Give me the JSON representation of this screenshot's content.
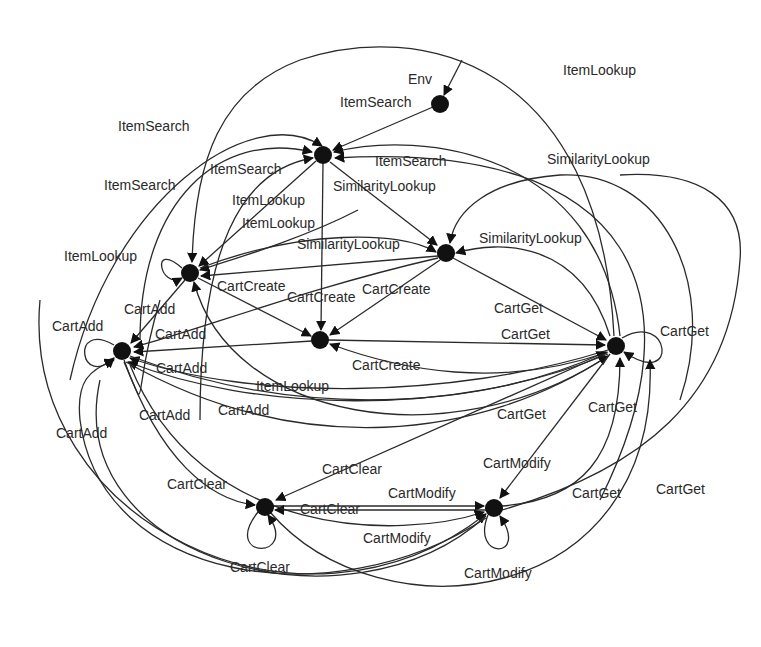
{
  "diagram": {
    "title": "",
    "start_label": "Env",
    "nodes": [
      {
        "id": "start",
        "x": 440,
        "y": 104
      },
      {
        "id": "itemsearch",
        "x": 323,
        "y": 155
      },
      {
        "id": "itemlookup",
        "x": 190,
        "y": 273
      },
      {
        "id": "similarity",
        "x": 446,
        "y": 253
      },
      {
        "id": "cartcreate",
        "x": 320,
        "y": 340
      },
      {
        "id": "cartadd",
        "x": 122,
        "y": 351
      },
      {
        "id": "cartget",
        "x": 616,
        "y": 346
      },
      {
        "id": "cartclear",
        "x": 265,
        "y": 507
      },
      {
        "id": "cartmodify",
        "x": 494,
        "y": 508
      }
    ],
    "labels": [
      {
        "text": "Env",
        "x": 408,
        "y": 84
      },
      {
        "text": "ItemSearch",
        "x": 340,
        "y": 107
      },
      {
        "text": "ItemLookup",
        "x": 563,
        "y": 75
      },
      {
        "text": "ItemSearch",
        "x": 118,
        "y": 131
      },
      {
        "text": "ItemSearch",
        "x": 375,
        "y": 166
      },
      {
        "text": "ItemSearch",
        "x": 210,
        "y": 174
      },
      {
        "text": "ItemSearch",
        "x": 104,
        "y": 190
      },
      {
        "text": "SimilarityLookup",
        "x": 547,
        "y": 164
      },
      {
        "text": "SimilarityLookup",
        "x": 333,
        "y": 191
      },
      {
        "text": "ItemLookup",
        "x": 232,
        "y": 205
      },
      {
        "text": "ItemLookup",
        "x": 242,
        "y": 228
      },
      {
        "text": "SimilarityLookup",
        "x": 297,
        "y": 249
      },
      {
        "text": "SimilarityLookup",
        "x": 479,
        "y": 243
      },
      {
        "text": "ItemLookup",
        "x": 64,
        "y": 261
      },
      {
        "text": "CartCreate",
        "x": 217,
        "y": 291
      },
      {
        "text": "CartCreate",
        "x": 287,
        "y": 302
      },
      {
        "text": "CartCreate",
        "x": 362,
        "y": 294
      },
      {
        "text": "CartAdd",
        "x": 124,
        "y": 314
      },
      {
        "text": "CartGet",
        "x": 494,
        "y": 313
      },
      {
        "text": "CartAdd",
        "x": 52,
        "y": 331
      },
      {
        "text": "CartAdd",
        "x": 155,
        "y": 339
      },
      {
        "text": "CartGet",
        "x": 501,
        "y": 339
      },
      {
        "text": "CartGet",
        "x": 660,
        "y": 336
      },
      {
        "text": "CartAdd",
        "x": 156,
        "y": 373
      },
      {
        "text": "CartCreate",
        "x": 352,
        "y": 370
      },
      {
        "text": "ItemLookup",
        "x": 256,
        "y": 391
      },
      {
        "text": "CartAdd",
        "x": 218,
        "y": 415
      },
      {
        "text": "CartGet",
        "x": 497,
        "y": 419
      },
      {
        "text": "CartGet",
        "x": 588,
        "y": 412
      },
      {
        "text": "CartAdd",
        "x": 139,
        "y": 420
      },
      {
        "text": "CartAdd",
        "x": 56,
        "y": 438
      },
      {
        "text": "CartClear",
        "x": 322,
        "y": 474
      },
      {
        "text": "CartModify",
        "x": 483,
        "y": 468
      },
      {
        "text": "CartClear",
        "x": 167,
        "y": 489
      },
      {
        "text": "CartModify",
        "x": 388,
        "y": 498
      },
      {
        "text": "CartGet",
        "x": 572,
        "y": 498
      },
      {
        "text": "CartGet",
        "x": 656,
        "y": 494
      },
      {
        "text": "CartClear",
        "x": 300,
        "y": 514
      },
      {
        "text": "CartModify",
        "x": 363,
        "y": 543
      },
      {
        "text": "CartClear",
        "x": 230,
        "y": 572
      },
      {
        "text": "CartModify",
        "x": 464,
        "y": 578
      }
    ]
  }
}
